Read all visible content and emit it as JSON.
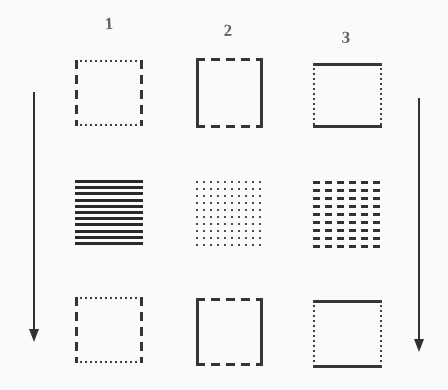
{
  "figure": {
    "background_color": "#fefefe",
    "ink_color": "#2b2b2b",
    "columns": [
      {
        "label": "1"
      },
      {
        "label": "2"
      },
      {
        "label": "3"
      }
    ],
    "rows": [
      {
        "row_index": 1,
        "kind": "outline",
        "cells": [
          {
            "column": "1",
            "pattern_name": "dashed-sides-dotted-top-bottom",
            "top_edge": "dotted-fine",
            "bottom_edge": "dotted-fine",
            "left_edge": "dashed-long",
            "right_edge": "dashed-long"
          },
          {
            "column": "2",
            "pattern_name": "solid-sides-dashed-top-bottom",
            "top_edge": "dashed-med",
            "bottom_edge": "dashed-med",
            "left_edge": "solid",
            "right_edge": "solid"
          },
          {
            "column": "3",
            "pattern_name": "solid-top-bottom-dotted-sides",
            "top_edge": "solid",
            "bottom_edge": "solid",
            "left_edge": "dotted-fine",
            "right_edge": "dotted-fine"
          }
        ]
      },
      {
        "row_index": 2,
        "kind": "fill-texture",
        "cells": [
          {
            "column": "1",
            "pattern_name": "horizontal-solid-stripes",
            "texture": "stripes-h",
            "line_count": 11
          },
          {
            "column": "2",
            "pattern_name": "fine-dot-matrix",
            "texture": "dot-grid",
            "dot_columns": 10,
            "dot_rows": 10
          },
          {
            "column": "3",
            "pattern_name": "short-dash-matrix",
            "texture": "dash-grid",
            "dash_columns": 6,
            "dash_rows": 8
          }
        ]
      },
      {
        "row_index": 3,
        "kind": "outline",
        "cells": [
          {
            "column": "1",
            "pattern_name": "dashed-sides-dotted-top-bottom",
            "top_edge": "dotted-fine",
            "bottom_edge": "dotted-fine",
            "left_edge": "dashed-long",
            "right_edge": "dashed-long"
          },
          {
            "column": "2",
            "pattern_name": "solid-sides-dashed-top-bottom",
            "top_edge": "dashed-med",
            "bottom_edge": "dashed-med",
            "left_edge": "solid",
            "right_edge": "solid"
          },
          {
            "column": "3",
            "pattern_name": "solid-top-bottom-dotted-sides",
            "top_edge": "solid",
            "bottom_edge": "solid",
            "left_edge": "dotted-fine",
            "right_edge": "dotted-fine"
          }
        ]
      }
    ],
    "arrows": [
      {
        "id": "left",
        "direction": "down",
        "label": ""
      },
      {
        "id": "right",
        "direction": "down",
        "label": ""
      }
    ]
  }
}
